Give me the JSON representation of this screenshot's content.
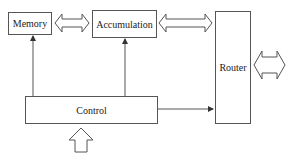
{
  "diagram": {
    "nodes": {
      "memory": {
        "label": "Memory"
      },
      "accumulation": {
        "label": "Accumulation"
      },
      "router": {
        "label": "Router"
      },
      "control": {
        "label": "Control"
      }
    },
    "edges": [
      {
        "from": "memory",
        "to": "accumulation",
        "type": "double-arrow"
      },
      {
        "from": "accumulation",
        "to": "router",
        "type": "double-arrow"
      },
      {
        "from": "router",
        "to": "external",
        "type": "double-arrow"
      },
      {
        "from": "control",
        "to": "memory",
        "type": "arrow"
      },
      {
        "from": "control",
        "to": "accumulation",
        "type": "arrow"
      },
      {
        "from": "control",
        "to": "router",
        "type": "arrow"
      },
      {
        "from": "input",
        "to": "control",
        "type": "block-arrow-up"
      }
    ]
  },
  "colors": {
    "stroke": "#555555",
    "background": "#ffffff"
  }
}
